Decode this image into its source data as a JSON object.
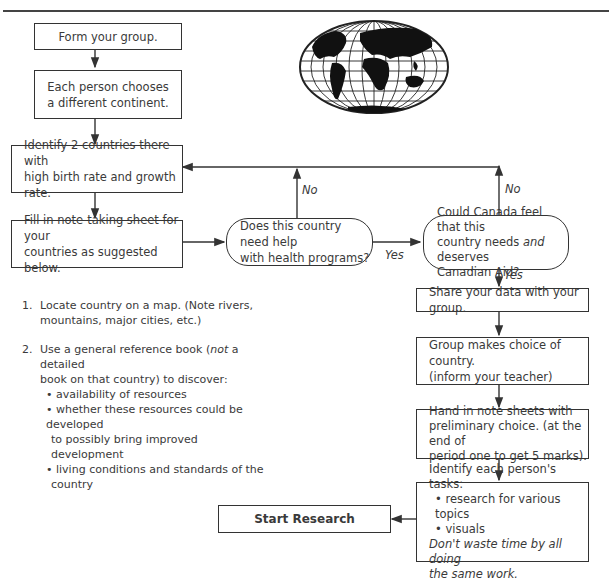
{
  "diagram": {
    "type": "flowchart",
    "steps": {
      "form_group": "Form your group.",
      "choose_continent": [
        "Each person chooses",
        "a different continent."
      ],
      "identify_countries": [
        "Identify 2 countries there with",
        "high birth rate and growth rate."
      ],
      "fill_sheet": [
        "Fill in note-taking sheet for your",
        "countries as suggested below."
      ],
      "decision_health": [
        "Does this country need help",
        "with health programs?"
      ],
      "decision_aid": [
        "Could Canada feel that this",
        "country needs ",
        "and",
        " deserves",
        "Canadian Aid?"
      ],
      "share_data": "Share your data with your group.",
      "group_choice": [
        "Group makes choice of country.",
        "(inform your teacher)"
      ],
      "hand_in": [
        "Hand in note sheets with",
        "preliminary choice. (at the end of",
        "period one to get 5 marks)."
      ],
      "identify_tasks": {
        "title": "Identify each person's tasks:",
        "bullets": [
          "research for various topics",
          "visuals"
        ],
        "note": [
          "Don't waste time by all doing",
          "the same work."
        ]
      },
      "start_research": "Start Research"
    },
    "labels": {
      "no_1": "No",
      "no_2": "No",
      "yes_1": "Yes",
      "yes_2": "Yes"
    },
    "instructions": [
      {
        "num": "1.",
        "lines": [
          "Locate country on a map. (Note rivers,",
          "mountains, major cities, etc.)"
        ]
      },
      {
        "num": "2.",
        "line1_pre": "Use a general reference book (",
        "line1_em": "not",
        "line1_post": " a detailed",
        "line2": "book on that country) to discover:",
        "bullets": [
          [
            "availability of resources"
          ],
          [
            "whether these resources could be developed",
            "to possibly bring improved development"
          ],
          [
            "living conditions and standards of the",
            "country"
          ]
        ]
      }
    ],
    "image": "world-map-globe"
  }
}
